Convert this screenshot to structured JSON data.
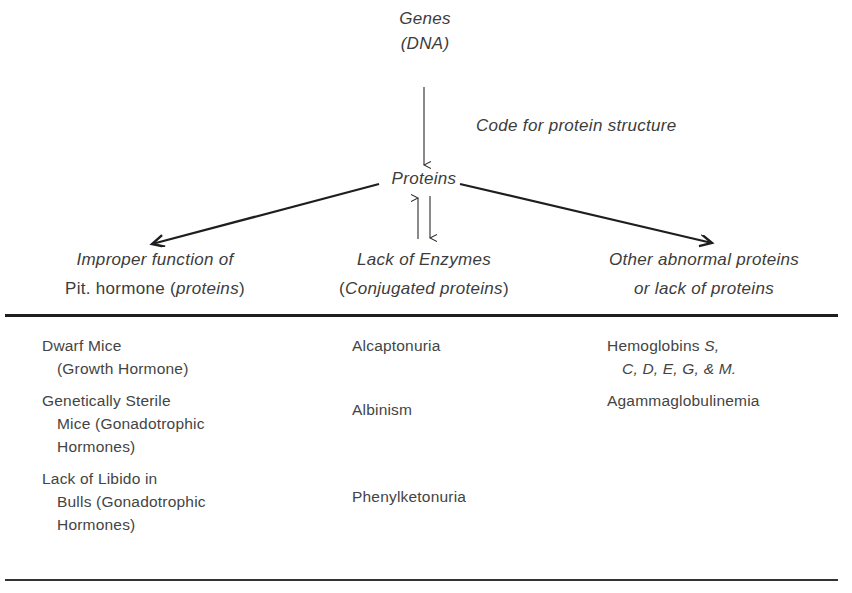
{
  "diagram": {
    "root": {
      "line1": "Genes",
      "line2": "(DNA)"
    },
    "edge_label": "Code for protein structure",
    "middle": "Proteins",
    "branches": [
      {
        "line1": "Improper function of",
        "line2_prefix": "Pit. hormone (",
        "line2_em": "proteins",
        "line2_suffix": ")"
      },
      {
        "line1": "Lack of Enzymes",
        "line2_prefix": "(",
        "line2_em": "Conjugated proteins",
        "line2_suffix": ")"
      },
      {
        "line1": "Other abnormal proteins",
        "line2": "or lack of proteins"
      }
    ]
  },
  "table": {
    "columns": [
      {
        "items": [
          {
            "line1": "Dwarf Mice",
            "rest": [
              "(Growth Hormone)"
            ]
          },
          {
            "line1": "Genetically Sterile",
            "rest": [
              "Mice (Gonadotrophic",
              "Hormones)"
            ]
          },
          {
            "line1": "Lack of Libido in",
            "rest": [
              "Bulls (Gonadotrophic",
              "Hormones)"
            ]
          }
        ]
      },
      {
        "items": [
          {
            "line1": "Alcaptonuria"
          },
          {
            "line1": "Albinism"
          },
          {
            "line1": "Phenylketonuria"
          }
        ]
      },
      {
        "items": [
          {
            "line1_prefix": "Hemoglobins ",
            "line1_em": "S,",
            "line2_em": "C, D, E, G, & M."
          },
          {
            "line1": "Agammaglobulinemia"
          }
        ]
      }
    ]
  },
  "colors": {
    "ink": "#2a2a2a",
    "text": "#3c3c3c",
    "background": "#ffffff"
  }
}
